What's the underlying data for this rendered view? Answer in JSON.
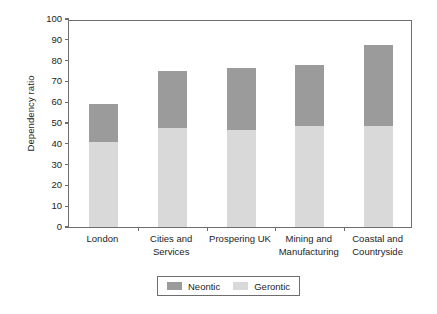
{
  "chart_data": {
    "type": "bar",
    "subtype": "stacked-vertical",
    "title": "",
    "xlabel": "",
    "ylabel": "Dependency ratio",
    "ylim": [
      0,
      100
    ],
    "ytick_step": 10,
    "yticks": [
      100,
      90,
      80,
      70,
      60,
      50,
      40,
      30,
      20,
      10,
      0
    ],
    "ytick_labels": [
      "100",
      "90",
      "80",
      "70",
      "60",
      "50",
      "40",
      "30",
      "20",
      "10",
      "0"
    ],
    "grid": false,
    "legend_position": "bottom-center",
    "categories": [
      "London",
      "Cities and Services",
      "Prospering UK",
      "Mining and Manufacturing",
      "Coastal and Countryside"
    ],
    "category_lines": [
      [
        "London"
      ],
      [
        "Cities and",
        "Services"
      ],
      [
        "Prospering UK"
      ],
      [
        "Mining and",
        "Manufacturing"
      ],
      [
        "Coastal and",
        "Countryside"
      ]
    ],
    "series": [
      {
        "name": "Gerontic",
        "color": "#d9d9d9",
        "stack_order": 0,
        "values": [
          41,
          47.5,
          46.5,
          48.5,
          48.5
        ]
      },
      {
        "name": "Neontic",
        "color": "#9b9b9b",
        "stack_order": 1,
        "values": [
          18,
          27.5,
          30,
          29.5,
          39
        ]
      }
    ],
    "totals": [
      59,
      75,
      76.5,
      78,
      87.5
    ]
  },
  "legend": {
    "entries": [
      {
        "label": "Neontic",
        "color": "#9b9b9b"
      },
      {
        "label": "Gerontic",
        "color": "#d9d9d9"
      }
    ]
  },
  "axis": {
    "y_title": "Dependency ratio"
  }
}
